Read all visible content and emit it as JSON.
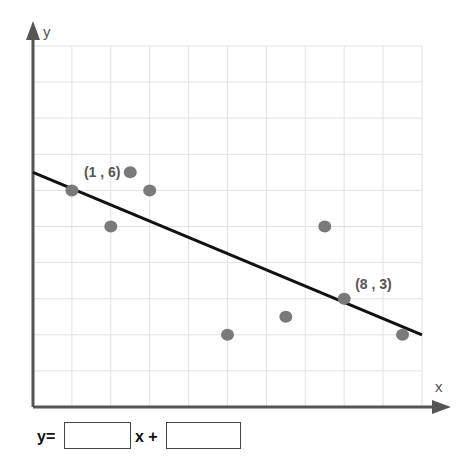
{
  "chart_data": {
    "type": "scatter",
    "title": "",
    "xlabel": "x",
    "ylabel": "y",
    "xlim": [
      0,
      10
    ],
    "ylim": [
      0,
      10
    ],
    "grid": true,
    "tick_labels_shown": false,
    "series": [
      {
        "name": "data points",
        "kind": "scatter",
        "points": [
          {
            "x": 1,
            "y": 6
          },
          {
            "x": 2,
            "y": 5
          },
          {
            "x": 2.5,
            "y": 6.5
          },
          {
            "x": 3,
            "y": 6
          },
          {
            "x": 5,
            "y": 2
          },
          {
            "x": 6.5,
            "y": 2.5
          },
          {
            "x": 7.5,
            "y": 5
          },
          {
            "x": 8,
            "y": 3
          },
          {
            "x": 9.5,
            "y": 2
          }
        ]
      },
      {
        "name": "line of best fit",
        "kind": "line",
        "points": [
          {
            "x": 0,
            "y": 6.5
          },
          {
            "x": 10,
            "y": 2
          }
        ]
      }
    ],
    "annotations": [
      {
        "text": "(1 , 6)",
        "x": 1,
        "y": 6
      },
      {
        "text": "(8 , 3)",
        "x": 8,
        "y": 3
      }
    ]
  },
  "colors": {
    "axis": "#555555",
    "grid": "#e2e2e2",
    "point": "#7a7a7a",
    "line": "#111111",
    "label": "#555555"
  },
  "equation": {
    "prefix": "y=",
    "middle": "x +",
    "slope_value": "",
    "intercept_value": ""
  }
}
